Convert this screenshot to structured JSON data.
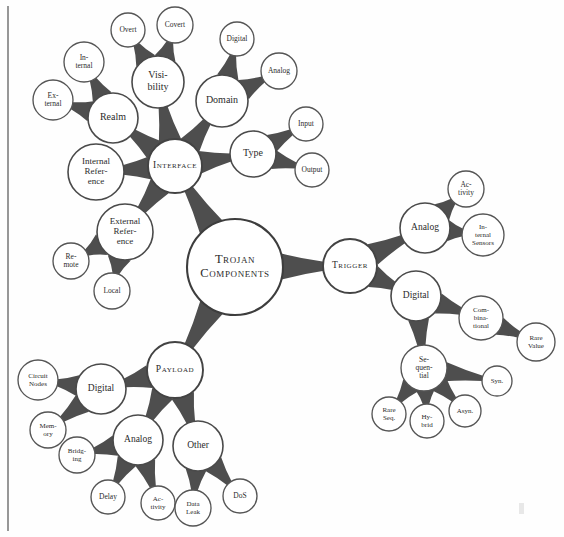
{
  "page": {
    "background_color": "#fefefe",
    "ink_color": "#4a4a4a",
    "text_color": "#2b2b2b",
    "width": 564,
    "height": 537
  },
  "margin_rule": {
    "x": 8,
    "y1": 6,
    "y2": 531,
    "color": "#6b6b6b"
  },
  "root": {
    "id": "root",
    "label": "Trojan Components",
    "lines": [
      "Trojan",
      "Components"
    ],
    "x": 235,
    "y": 267,
    "r": 48,
    "level": 0,
    "font_size": 12.5,
    "style": "smallcaps"
  },
  "nodes": [
    {
      "id": "interface",
      "label": "Interface",
      "lines": [
        "Interface"
      ],
      "x": 175,
      "y": 166,
      "r": 27,
      "level": 1,
      "font_size": 9.5,
      "style": "smallcaps",
      "parent": "root"
    },
    {
      "id": "trigger",
      "label": "Trigger",
      "lines": [
        "Trigger"
      ],
      "x": 350,
      "y": 266,
      "r": 27,
      "level": 1,
      "font_size": 9.5,
      "style": "smallcaps",
      "parent": "root"
    },
    {
      "id": "payload",
      "label": "Payload",
      "lines": [
        "Payload"
      ],
      "x": 175,
      "y": 370,
      "r": 28,
      "level": 1,
      "font_size": 9.5,
      "style": "smallcaps",
      "parent": "root"
    },
    {
      "id": "realm",
      "label": "Realm",
      "lines": [
        "Realm"
      ],
      "x": 113,
      "y": 118,
      "r": 25,
      "level": 2,
      "font_size": 10,
      "style": "normal",
      "parent": "interface"
    },
    {
      "id": "realm-internal",
      "label": "Internal",
      "lines": [
        "In-",
        "ternal"
      ],
      "x": 84,
      "y": 62,
      "r": 20,
      "level": 3,
      "font_size": 7.5,
      "style": "normal",
      "parent": "realm"
    },
    {
      "id": "realm-external",
      "label": "External",
      "lines": [
        "Ex-",
        "ternal"
      ],
      "x": 53,
      "y": 100,
      "r": 20,
      "level": 3,
      "font_size": 7.5,
      "style": "normal",
      "parent": "realm"
    },
    {
      "id": "visibility",
      "label": "Visibility",
      "lines": [
        "Visi-",
        "bility"
      ],
      "x": 158,
      "y": 82,
      "r": 26,
      "level": 2,
      "font_size": 10,
      "style": "normal",
      "parent": "interface"
    },
    {
      "id": "vis-overt",
      "label": "Overt",
      "lines": [
        "Overt"
      ],
      "x": 128,
      "y": 30,
      "r": 17,
      "level": 3,
      "font_size": 7.5,
      "style": "normal",
      "parent": "visibility"
    },
    {
      "id": "vis-covert",
      "label": "Covert",
      "lines": [
        "Covert"
      ],
      "x": 175,
      "y": 25,
      "r": 18,
      "level": 3,
      "font_size": 7.5,
      "style": "normal",
      "parent": "visibility"
    },
    {
      "id": "domain",
      "label": "Domain",
      "lines": [
        "Domain"
      ],
      "x": 222,
      "y": 101,
      "r": 26,
      "level": 2,
      "font_size": 10,
      "style": "normal",
      "parent": "interface"
    },
    {
      "id": "dom-digital",
      "label": "Digital",
      "lines": [
        "Digital"
      ],
      "x": 237,
      "y": 39,
      "r": 17,
      "level": 3,
      "font_size": 7.5,
      "style": "normal",
      "parent": "domain"
    },
    {
      "id": "dom-analog",
      "label": "Analog",
      "lines": [
        "Analog"
      ],
      "x": 279,
      "y": 71,
      "r": 18,
      "level": 3,
      "font_size": 7.5,
      "style": "normal",
      "parent": "domain"
    },
    {
      "id": "type",
      "label": "Type",
      "lines": [
        "Type"
      ],
      "x": 253,
      "y": 154,
      "r": 23,
      "level": 2,
      "font_size": 10,
      "style": "normal",
      "parent": "interface"
    },
    {
      "id": "type-input",
      "label": "Input",
      "lines": [
        "Input"
      ],
      "x": 306,
      "y": 124,
      "r": 17,
      "level": 3,
      "font_size": 7.5,
      "style": "normal",
      "parent": "type"
    },
    {
      "id": "type-output",
      "label": "Output",
      "lines": [
        "Output"
      ],
      "x": 312,
      "y": 170,
      "r": 17,
      "level": 3,
      "font_size": 7.5,
      "style": "normal",
      "parent": "type"
    },
    {
      "id": "internal-ref",
      "label": "Internal Reference",
      "lines": [
        "Internal",
        "Refer-",
        "ence"
      ],
      "x": 96,
      "y": 172,
      "r": 28,
      "level": 2,
      "font_size": 9,
      "style": "normal",
      "parent": "interface"
    },
    {
      "id": "external-ref",
      "label": "External Reference",
      "lines": [
        "External",
        "Refer-",
        "ence"
      ],
      "x": 125,
      "y": 232,
      "r": 28,
      "level": 2,
      "font_size": 9,
      "style": "normal",
      "parent": "interface"
    },
    {
      "id": "ext-remote",
      "label": "Remote",
      "lines": [
        "Re-",
        "mote"
      ],
      "x": 71,
      "y": 261,
      "r": 18,
      "level": 3,
      "font_size": 7.5,
      "style": "normal",
      "parent": "external-ref"
    },
    {
      "id": "ext-local",
      "label": "Local",
      "lines": [
        "Local"
      ],
      "x": 112,
      "y": 291,
      "r": 18,
      "level": 3,
      "font_size": 7.5,
      "style": "normal",
      "parent": "external-ref"
    },
    {
      "id": "trig-analog",
      "label": "Analog",
      "lines": [
        "Analog"
      ],
      "x": 425,
      "y": 228,
      "r": 25,
      "level": 2,
      "font_size": 9.5,
      "style": "normal",
      "parent": "trigger"
    },
    {
      "id": "trig-activity",
      "label": "Activity",
      "lines": [
        "Ac-",
        "tivity"
      ],
      "x": 466,
      "y": 189,
      "r": 18,
      "level": 3,
      "font_size": 7.5,
      "style": "normal",
      "parent": "trig-analog"
    },
    {
      "id": "trig-sensors",
      "label": "Internal Sensors",
      "lines": [
        "In-",
        "ternal",
        "Sensors"
      ],
      "x": 483,
      "y": 235,
      "r": 21,
      "level": 3,
      "font_size": 7,
      "style": "normal",
      "parent": "trig-analog"
    },
    {
      "id": "trig-digital",
      "label": "Digital",
      "lines": [
        "Digital"
      ],
      "x": 416,
      "y": 296,
      "r": 25,
      "level": 2,
      "font_size": 9.5,
      "style": "normal",
      "parent": "trigger"
    },
    {
      "id": "trig-comb",
      "label": "Combinational",
      "lines": [
        "Com-",
        "bina-",
        "tional"
      ],
      "x": 481,
      "y": 318,
      "r": 22,
      "level": 3,
      "font_size": 7,
      "style": "normal",
      "parent": "trig-digital"
    },
    {
      "id": "trig-rarevalue",
      "label": "Rare Value",
      "lines": [
        "Rare",
        "Value"
      ],
      "x": 536,
      "y": 342,
      "r": 19,
      "level": 3,
      "font_size": 7,
      "style": "normal",
      "parent": "trig-comb"
    },
    {
      "id": "trig-seq",
      "label": "Sequential",
      "lines": [
        "Se-",
        "quen-",
        "tial"
      ],
      "x": 424,
      "y": 368,
      "r": 23,
      "level": 3,
      "font_size": 7.5,
      "style": "normal",
      "parent": "trig-digital"
    },
    {
      "id": "trig-syn",
      "label": "Syn.",
      "lines": [
        "Syn."
      ],
      "x": 497,
      "y": 381,
      "r": 15,
      "level": 3,
      "font_size": 7,
      "style": "normal",
      "parent": "trig-seq"
    },
    {
      "id": "trig-async",
      "label": "Async.",
      "lines": [
        "Asyn."
      ],
      "x": 465,
      "y": 411,
      "r": 16,
      "level": 3,
      "font_size": 7,
      "style": "normal",
      "parent": "trig-seq"
    },
    {
      "id": "trig-hybrid",
      "label": "Hybrid",
      "lines": [
        "Hy-",
        "brid"
      ],
      "x": 427,
      "y": 421,
      "r": 17,
      "level": 3,
      "font_size": 7,
      "style": "normal",
      "parent": "trig-seq"
    },
    {
      "id": "trig-rareseq",
      "label": "Rare Seq.",
      "lines": [
        "Rare",
        "Seq."
      ],
      "x": 389,
      "y": 414,
      "r": 17,
      "level": 3,
      "font_size": 7,
      "style": "normal",
      "parent": "trig-seq"
    },
    {
      "id": "pay-digital",
      "label": "Digital",
      "lines": [
        "Digital"
      ],
      "x": 101,
      "y": 389,
      "r": 25,
      "level": 2,
      "font_size": 9.5,
      "style": "normal",
      "parent": "payload"
    },
    {
      "id": "pay-circuitnodes",
      "label": "Circuit Nodes",
      "lines": [
        "Circuit",
        "Nodes"
      ],
      "x": 38,
      "y": 380,
      "r": 20,
      "level": 3,
      "font_size": 7,
      "style": "normal",
      "parent": "pay-digital"
    },
    {
      "id": "pay-memory",
      "label": "Memory",
      "lines": [
        "Mem-",
        "ory"
      ],
      "x": 48,
      "y": 430,
      "r": 18,
      "level": 3,
      "font_size": 7,
      "style": "normal",
      "parent": "pay-digital"
    },
    {
      "id": "pay-analog",
      "label": "Analog",
      "lines": [
        "Analog"
      ],
      "x": 138,
      "y": 440,
      "r": 25,
      "level": 2,
      "font_size": 9.5,
      "style": "normal",
      "parent": "payload"
    },
    {
      "id": "pay-bridging",
      "label": "Bridging",
      "lines": [
        "Bridg-",
        "ing"
      ],
      "x": 77,
      "y": 455,
      "r": 18,
      "level": 3,
      "font_size": 7,
      "style": "normal",
      "parent": "pay-analog"
    },
    {
      "id": "pay-delay",
      "label": "Delay",
      "lines": [
        "Delay"
      ],
      "x": 108,
      "y": 497,
      "r": 17,
      "level": 3,
      "font_size": 7.5,
      "style": "normal",
      "parent": "pay-analog"
    },
    {
      "id": "pay-activity",
      "label": "Activity",
      "lines": [
        "Ac-",
        "tivity"
      ],
      "x": 158,
      "y": 503,
      "r": 17,
      "level": 3,
      "font_size": 7,
      "style": "normal",
      "parent": "pay-analog"
    },
    {
      "id": "pay-other",
      "label": "Other",
      "lines": [
        "Other"
      ],
      "x": 198,
      "y": 446,
      "r": 25,
      "level": 2,
      "font_size": 9.5,
      "style": "normal",
      "parent": "payload"
    },
    {
      "id": "pay-dataleak",
      "label": "Data Leak",
      "lines": [
        "Data",
        "Leak"
      ],
      "x": 193,
      "y": 508,
      "r": 18,
      "level": 3,
      "font_size": 7,
      "style": "normal",
      "parent": "pay-other"
    },
    {
      "id": "pay-dos",
      "label": "DoS",
      "lines": [
        "DoS"
      ],
      "x": 240,
      "y": 496,
      "r": 17,
      "level": 3,
      "font_size": 7.5,
      "style": "normal",
      "parent": "pay-other"
    }
  ]
}
